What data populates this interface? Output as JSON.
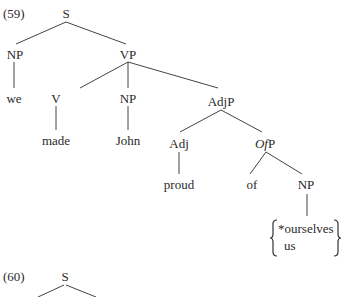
{
  "example59": {
    "number": "(59)",
    "nodes": {
      "S": "S",
      "NP_subj": "NP",
      "VP": "VP",
      "we": "we",
      "V": "V",
      "NP_obj": "NP",
      "AdjP": "AdjP",
      "made": "made",
      "John": "John",
      "Adj": "Adj",
      "OfP_of": "Of",
      "OfP_P": "P",
      "proud": "proud",
      "of": "of",
      "NP_of": "NP"
    },
    "alternatives": [
      "*ourselves",
      "us"
    ]
  },
  "example60": {
    "number": "(60)",
    "nodes": {
      "S": "S"
    }
  }
}
